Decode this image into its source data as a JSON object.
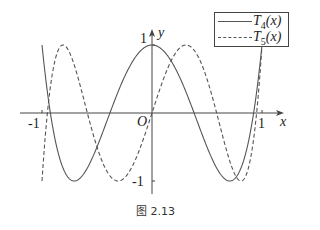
{
  "chart_data": {
    "type": "line",
    "title": "",
    "caption": "图 2.13",
    "xlabel": "x",
    "ylabel": "y",
    "xlim": [
      -1.08,
      1.18
    ],
    "ylim": [
      -1.2,
      1.2
    ],
    "grid": false,
    "legend_position": "upper right",
    "ticks": {
      "x": [
        {
          "value": -1,
          "label": "-1"
        },
        {
          "value": 1,
          "label": "1"
        }
      ],
      "y": [
        {
          "value": 1,
          "label": "1"
        },
        {
          "value": -1,
          "label": "-1"
        }
      ],
      "origin_label": "O"
    },
    "x": [
      -1.0,
      -0.95,
      -0.9,
      -0.85,
      -0.8,
      -0.75,
      -0.7,
      -0.65,
      -0.6,
      -0.55,
      -0.5,
      -0.45,
      -0.4,
      -0.35,
      -0.3,
      -0.25,
      -0.2,
      -0.15,
      -0.1,
      -0.05,
      0.0,
      0.05,
      0.1,
      0.15,
      0.2,
      0.25,
      0.3,
      0.35,
      0.4,
      0.45,
      0.5,
      0.55,
      0.6,
      0.65,
      0.7,
      0.75,
      0.8,
      0.85,
      0.9,
      0.95,
      1.0
    ],
    "series": [
      {
        "name": "T4(x)",
        "label_main": "T",
        "label_sub": "4",
        "label_tail": "(x)",
        "style": "solid",
        "color": "#555555",
        "values": [
          1.0,
          0.3151,
          -0.2312,
          -0.6319,
          -0.8912,
          -1.0,
          -0.9392,
          -0.6999,
          -0.3152,
          0.1231,
          0.5,
          0.6617,
          0.5568,
          0.2217,
          -0.1152,
          -0.3438,
          -0.3728,
          -0.1577,
          0.0,
          0.0,
          1.0,
          0.9801,
          0.9208,
          0.8241,
          0.6928,
          0.5313,
          0.3448,
          0.1401,
          -0.0752,
          -0.2919,
          -0.5,
          -0.6909,
          -0.8432,
          -0.9495,
          -0.9992,
          -0.9805,
          -0.8912,
          -0.7265,
          -0.2312,
          0.3151,
          1.0
        ]
      },
      {
        "name": "T5(x)",
        "label_main": "T",
        "label_sub": "5",
        "label_tail": "(x)",
        "style": "dashed",
        "color": "#555555",
        "values": [
          -1.0,
          0.2,
          0.6,
          0.85,
          0.99,
          0.95,
          0.7,
          0.35,
          -0.08,
          -0.45,
          -0.5,
          -0.95,
          -0.98,
          -0.87,
          -0.61,
          -0.26,
          0.19,
          0.56,
          0.88,
          1.0,
          0.0,
          0.25,
          0.48,
          0.68,
          0.84,
          0.95,
          1.0,
          0.97,
          0.88,
          0.72,
          0.5,
          0.22,
          -0.08,
          -0.4,
          -0.7,
          -0.93,
          -0.99,
          -0.8,
          -0.26,
          0.24,
          1.0
        ]
      }
    ]
  }
}
